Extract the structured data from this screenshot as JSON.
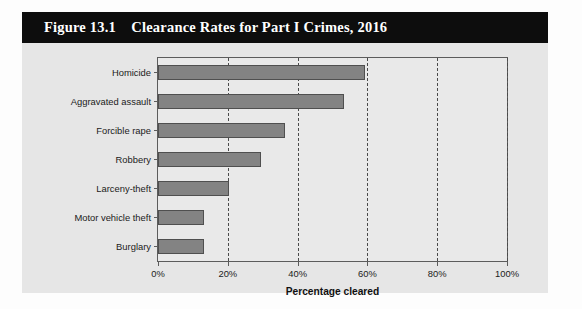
{
  "figure": {
    "title": "Figure 13.1    Clearance Rates for Part I Crimes, 2016",
    "title_bar_color": "#0d0d0d",
    "panel_color": "#e6e6e6"
  },
  "chart_data": {
    "type": "bar",
    "orientation": "horizontal",
    "title": "Clearance Rates for Part I Crimes, 2016",
    "xlabel": "Percentage cleared",
    "ylabel": "",
    "categories": [
      "Homicide",
      "Aggravated assault",
      "Forcible rape",
      "Robbery",
      "Larceny-theft",
      "Motor vehicle theft",
      "Burglary"
    ],
    "values": [
      59.4,
      53.3,
      36.5,
      29.6,
      20.4,
      13.3,
      13.1
    ],
    "xlim": [
      0,
      100
    ],
    "xticks": [
      0,
      20,
      40,
      60,
      80,
      100
    ],
    "xtick_labels": [
      "0%",
      "20%",
      "40%",
      "60%",
      "80%",
      "100%"
    ],
    "grid": "vertical-dashed",
    "legend": "none",
    "bar_color": "#838383",
    "bar_edge_color": "#4f4f4f",
    "plot_background": "#e9e9e9"
  }
}
